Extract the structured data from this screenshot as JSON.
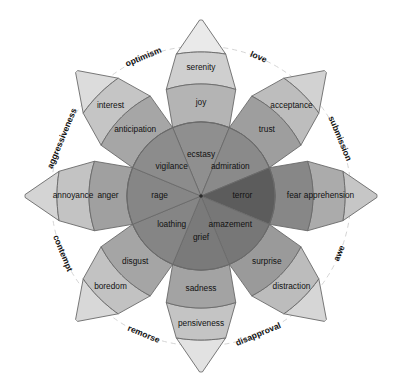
{
  "figure": {
    "type": "radial-emotion-wheel",
    "center": {
      "x": 201,
      "y": 196
    },
    "inner_radius": 74,
    "petal_radius": 176,
    "dashed_circle_radius": 150,
    "cropped_caption": ""
  },
  "palette": {
    "intense": "#7d7d7d",
    "primary": "#9a9a9a",
    "mild": "#b9b9b9",
    "faint": "#dedede",
    "terror_dark": "#5c5c5c",
    "fear_dark": "#878787",
    "apprehension": "#ababab",
    "outline": "#6a6a6a",
    "dashed": "#cfcfcf",
    "text": "#111111",
    "background": "#ffffff"
  },
  "petals": [
    {
      "id": "joy",
      "angle_deg": -90,
      "direction": "up",
      "intense": {
        "label": "ecstasy",
        "shade": "#8f8f8f"
      },
      "primary": {
        "label": "joy",
        "shade": "#b4b4b4"
      },
      "mild": {
        "label": "serenity",
        "shade": "#cfcfcf"
      },
      "tip": {
        "label": "",
        "shade": "#eaeaea"
      }
    },
    {
      "id": "trust",
      "angle_deg": -45,
      "direction": "up-right",
      "intense": {
        "label": "admiration",
        "shade": "#8a8a8a"
      },
      "primary": {
        "label": "trust",
        "shade": "#9e9e9e"
      },
      "mild": {
        "label": "acceptance",
        "shade": "#bdbdbd"
      },
      "tip": {
        "label": "",
        "shade": "#d2d2d2"
      }
    },
    {
      "id": "fear",
      "angle_deg": 0,
      "direction": "right",
      "intense": {
        "label": "terror",
        "shade": "#5c5c5c"
      },
      "primary": {
        "label": "fear",
        "shade": "#878787"
      },
      "mild": {
        "label": "apprehension",
        "shade": "#ababab"
      },
      "tip": {
        "label": "",
        "shade": "#c6c6c6"
      }
    },
    {
      "id": "surprise",
      "angle_deg": 45,
      "direction": "down-right",
      "intense": {
        "label": "amazement",
        "shade": "#777777"
      },
      "primary": {
        "label": "surprise",
        "shade": "#9a9a9a"
      },
      "mild": {
        "label": "distraction",
        "shade": "#bcbcbc"
      },
      "tip": {
        "label": "",
        "shade": "#d6d6d6"
      }
    },
    {
      "id": "sadness",
      "angle_deg": 90,
      "direction": "down",
      "intense": {
        "label": "grief",
        "shade": "#7a7a7a"
      },
      "primary": {
        "label": "sadness",
        "shade": "#a3a3a3"
      },
      "mild": {
        "label": "pensiveness",
        "shade": "#c4c4c4"
      },
      "tip": {
        "label": "",
        "shade": "#e2e2e2"
      }
    },
    {
      "id": "disgust",
      "angle_deg": 135,
      "direction": "down-left",
      "intense": {
        "label": "loathing",
        "shade": "#858585"
      },
      "primary": {
        "label": "disgust",
        "shade": "#a5a5a5"
      },
      "mild": {
        "label": "boredom",
        "shade": "#c2c2c2"
      },
      "tip": {
        "label": "",
        "shade": "#d8d8d8"
      }
    },
    {
      "id": "anger",
      "angle_deg": 180,
      "direction": "left",
      "intense": {
        "label": "rage",
        "shade": "#868686"
      },
      "primary": {
        "label": "anger",
        "shade": "#a0a0a0"
      },
      "mild": {
        "label": "annoyance",
        "shade": "#c3c3c3"
      },
      "tip": {
        "label": "",
        "shade": "#d4d4d4"
      }
    },
    {
      "id": "anticipation",
      "angle_deg": -135,
      "direction": "up-left",
      "intense": {
        "label": "vigilance",
        "shade": "#8c8c8c"
      },
      "primary": {
        "label": "anticipation",
        "shade": "#a6a6a6"
      },
      "mild": {
        "label": "interest",
        "shade": "#c5c5c5"
      },
      "tip": {
        "label": "",
        "shade": "#dcdcdc"
      }
    }
  ],
  "dyads": [
    {
      "id": "optimism",
      "label": "optimism",
      "angle_deg": -112.5
    },
    {
      "id": "love",
      "label": "love",
      "angle_deg": -67.5
    },
    {
      "id": "submission",
      "label": "submission",
      "angle_deg": -22.5
    },
    {
      "id": "awe",
      "label": "awe",
      "angle_deg": 22.5
    },
    {
      "id": "disapproval",
      "label": "disapproval",
      "angle_deg": 67.5
    },
    {
      "id": "remorse",
      "label": "remorse",
      "angle_deg": 112.5
    },
    {
      "id": "contempt",
      "label": "contempt",
      "angle_deg": 157.5
    },
    {
      "id": "aggressiveness",
      "label": "aggressiveness",
      "angle_deg": -157.5
    }
  ]
}
